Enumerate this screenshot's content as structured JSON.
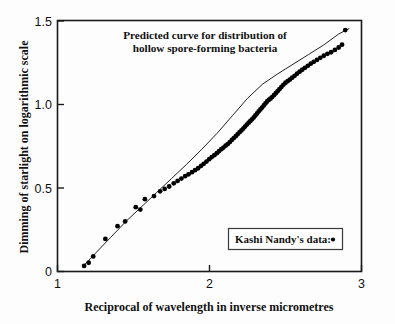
{
  "chart_data": {
    "type": "scatter",
    "title": "Predicted curve for distribution of hollow spore-forming bacteria",
    "title_line1": "Predicted curve for distribution of",
    "title_line2": "hollow spore-forming bacteria",
    "xlabel": "Reciprocal of wavelength in inverse micrometres",
    "ylabel": "Dimming of starlight on logarithmic scale",
    "xlim": [
      1,
      3
    ],
    "ylim": [
      -0.08,
      1.5
    ],
    "grid": false,
    "legend_position": "inside-lower-right",
    "xticks": [
      1,
      2,
      3
    ],
    "xticklabels": [
      "1",
      "2",
      "3"
    ],
    "yticks": [
      0,
      0.5,
      1.0,
      1.5
    ],
    "yticklabels": [
      "0",
      "0.5",
      "1.0",
      "1.5"
    ],
    "series": [
      {
        "name": "Predicted curve",
        "type": "line",
        "color": "#222222",
        "x": [
          1.17,
          1.25,
          1.35,
          1.45,
          1.55,
          1.65,
          1.75,
          1.85,
          1.95,
          2.05,
          2.15,
          2.25,
          2.35,
          2.45,
          2.55,
          2.65,
          2.75,
          2.85,
          2.92
        ],
        "y": [
          -0.045,
          0.035,
          0.135,
          0.235,
          0.325,
          0.415,
          0.505,
          0.595,
          0.69,
          0.79,
          0.9,
          1.01,
          1.1,
          1.165,
          1.225,
          1.285,
          1.345,
          1.415,
          1.45
        ]
      },
      {
        "name": "Kashi Nandy's data:",
        "type": "scatter",
        "marker": "circle",
        "color": "#000000",
        "x": [
          1.175,
          1.205,
          1.235,
          1.315,
          1.395,
          1.445,
          1.515,
          1.545,
          1.575,
          1.635,
          1.675,
          1.705,
          1.735,
          1.765,
          1.79,
          1.815,
          1.84,
          1.862,
          1.885,
          1.905,
          1.925,
          1.945,
          1.962,
          1.98,
          1.998,
          2.015,
          2.032,
          2.048,
          2.063,
          2.078,
          2.092,
          2.106,
          2.12,
          2.134,
          2.147,
          2.16,
          2.173,
          2.186,
          2.198,
          2.21,
          2.222,
          2.234,
          2.246,
          2.258,
          2.269,
          2.28,
          2.291,
          2.302,
          2.313,
          2.324,
          2.335,
          2.346,
          2.357,
          2.368,
          2.379,
          2.39,
          2.401,
          2.412,
          2.424,
          2.436,
          2.448,
          2.46,
          2.473,
          2.486,
          2.5,
          2.514,
          2.529,
          2.544,
          2.56,
          2.576,
          2.593,
          2.61,
          2.628,
          2.647,
          2.666,
          2.686,
          2.707,
          2.729,
          2.752,
          2.776,
          2.8,
          2.825,
          2.85,
          2.872,
          2.893
        ],
        "y": [
          -0.045,
          -0.025,
          0.015,
          0.125,
          0.205,
          0.235,
          0.325,
          0.31,
          0.375,
          0.395,
          0.425,
          0.44,
          0.455,
          0.475,
          0.49,
          0.505,
          0.52,
          0.532,
          0.545,
          0.558,
          0.57,
          0.585,
          0.598,
          0.612,
          0.627,
          0.64,
          0.652,
          0.665,
          0.678,
          0.69,
          0.7,
          0.712,
          0.722,
          0.735,
          0.748,
          0.76,
          0.772,
          0.785,
          0.797,
          0.808,
          0.82,
          0.832,
          0.845,
          0.857,
          0.868,
          0.878,
          0.89,
          0.902,
          0.915,
          0.928,
          0.94,
          0.952,
          0.965,
          0.978,
          0.99,
          1.0,
          1.008,
          1.018,
          1.03,
          1.042,
          1.055,
          1.068,
          1.082,
          1.095,
          1.108,
          1.118,
          1.128,
          1.14,
          1.152,
          1.165,
          1.178,
          1.19,
          1.202,
          1.215,
          1.228,
          1.24,
          1.252,
          1.265,
          1.278,
          1.29,
          1.3,
          1.315,
          1.33,
          1.348,
          1.44
        ]
      }
    ]
  },
  "legend": {
    "label": "Kashi Nandy's data:",
    "marker": "dot-marker"
  }
}
